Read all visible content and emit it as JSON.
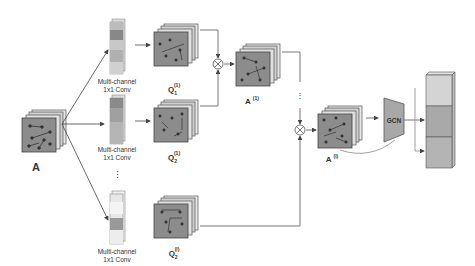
{
  "diagram": {
    "input": {
      "label": "A"
    },
    "conv_blocks": [
      {
        "label_line1": "Multi-channel",
        "label_line2": "1x1 Conv"
      },
      {
        "label_line1": "Multi-channel",
        "label_line2": "1x1 Conv"
      },
      {
        "label_line1": "Multi-channel",
        "label_line2": "1x1 Conv"
      }
    ],
    "q_outputs": [
      {
        "label": "Q",
        "sub": "1",
        "sup": "(1)"
      },
      {
        "label": "Q",
        "sub": "2",
        "sup": "(1)"
      },
      {
        "label": "Q",
        "sub": "2",
        "sup": "(l)"
      }
    ],
    "intermediate": {
      "label": "A",
      "sup": "(1)"
    },
    "final": {
      "label": "A",
      "sup": "(l)"
    },
    "gcn": {
      "label": "GCN"
    },
    "ellipsis": "⋮",
    "multiply_symbol": "⊗",
    "colors": {
      "cube_face": "#8c8c8c",
      "cube_side": "#bdbdbd",
      "line": "#555555",
      "gcn_fill": "#a8a8a8",
      "stack_top": "#d4d4d4",
      "stack_mid": "#a9a9a9",
      "stack_bot": "#b4b4b4"
    }
  }
}
